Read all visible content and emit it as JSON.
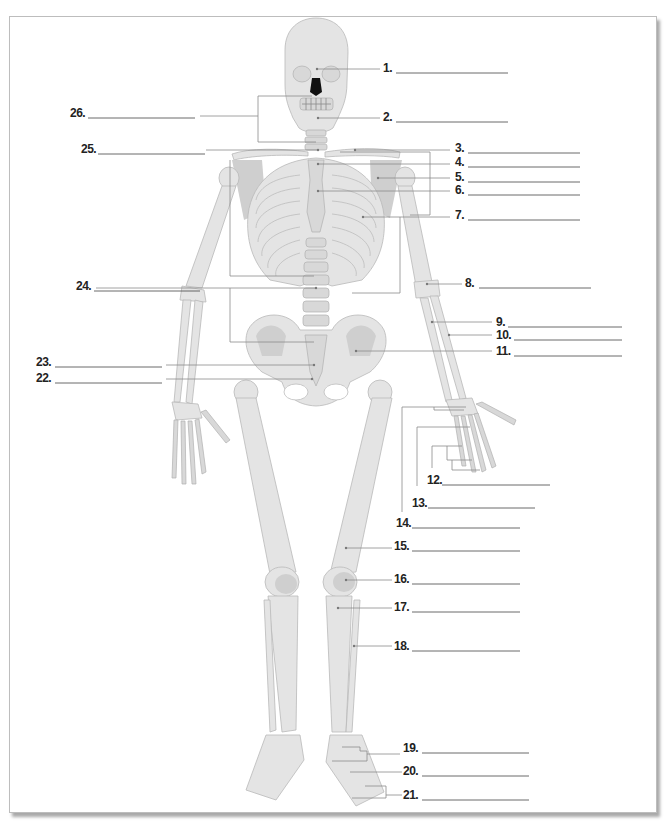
{
  "worksheet": {
    "title": "Human Skeleton Labeling Diagram",
    "labels": [
      {
        "number": "1.",
        "answer": ""
      },
      {
        "number": "2.",
        "answer": ""
      },
      {
        "number": "3.",
        "answer": ""
      },
      {
        "number": "4.",
        "answer": ""
      },
      {
        "number": "5.",
        "answer": ""
      },
      {
        "number": "6.",
        "answer": ""
      },
      {
        "number": "7.",
        "answer": ""
      },
      {
        "number": "8.",
        "answer": ""
      },
      {
        "number": "9.",
        "answer": ""
      },
      {
        "number": "10.",
        "answer": ""
      },
      {
        "number": "11.",
        "answer": ""
      },
      {
        "number": "12.",
        "answer": ""
      },
      {
        "number": "13.",
        "answer": ""
      },
      {
        "number": "14.",
        "answer": ""
      },
      {
        "number": "15.",
        "answer": ""
      },
      {
        "number": "16.",
        "answer": ""
      },
      {
        "number": "17.",
        "answer": ""
      },
      {
        "number": "18.",
        "answer": ""
      },
      {
        "number": "19.",
        "answer": ""
      },
      {
        "number": "20.",
        "answer": ""
      },
      {
        "number": "21.",
        "answer": ""
      },
      {
        "number": "22.",
        "answer": ""
      },
      {
        "number": "23.",
        "answer": ""
      },
      {
        "number": "24.",
        "answer": ""
      },
      {
        "number": "25.",
        "answer": ""
      },
      {
        "number": "26.",
        "answer": ""
      }
    ]
  }
}
